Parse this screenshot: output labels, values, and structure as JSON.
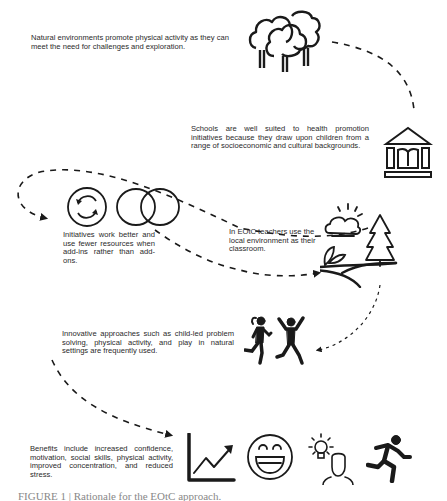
{
  "figure": {
    "caption": "FIGURE 1 | Rationale for the EOtC approach."
  },
  "steps": [
    {
      "id": "natural-environments",
      "text": "Natural environments promote physical activity as they can meet the need for challenges and exploration.",
      "icon": "trees-icon"
    },
    {
      "id": "schools",
      "text": "Schools are well suited to health promotion initiatives because they draw upon children from a range of socioeconomic and cultural backgrounds.",
      "icon": "school-building-icon"
    },
    {
      "id": "add-ins",
      "text": "Initiatives work better and use fewer resources when add-ins rather than add-ons.",
      "icons": [
        "cycle-arrows-icon",
        "venn-overlap-icon"
      ]
    },
    {
      "id": "eotc",
      "text": "In EOtC teachers use the local environment as their classroom.",
      "icon": "landscape-icon"
    },
    {
      "id": "innovative",
      "text": "Innovative approaches such as child-led problem solving, physical activity, and play in natural settings are frequently used.",
      "icon": "children-playing-icon"
    },
    {
      "id": "benefits",
      "text": "Benefits include increased confidence, motivation, social skills, physical activity, improved concentration, and reduced stress.",
      "icons": [
        "growth-chart-icon",
        "smiley-face-icon",
        "idea-person-icon",
        "running-person-icon"
      ]
    }
  ],
  "colors": {
    "ink": "#1a1a1a",
    "text": "#2a2a2a",
    "background": "#ffffff"
  }
}
